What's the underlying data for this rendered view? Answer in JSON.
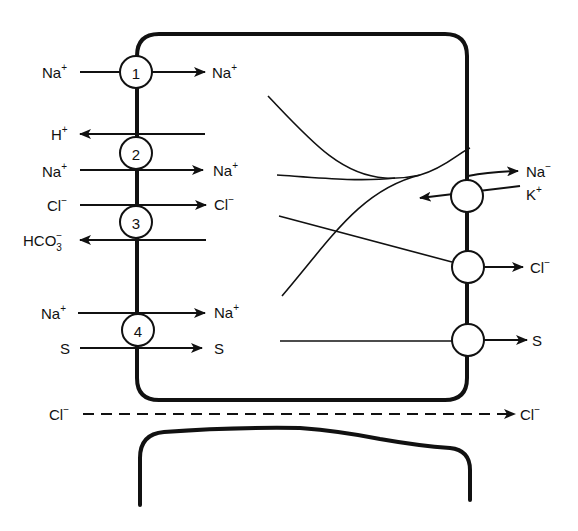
{
  "figure": {
    "type": "epithelial ion transport diagram",
    "apical_transporters": [
      {
        "id": "1",
        "label": "1",
        "in_label": "Na",
        "in_charge": "+",
        "out_label": "Na",
        "out_charge": "+",
        "description": "Na+ channel"
      },
      {
        "id": "2",
        "label": "2",
        "flows": [
          {
            "ion": "H",
            "charge": "+",
            "direction": "out"
          },
          {
            "ion": "Na",
            "charge": "+",
            "direction": "in"
          }
        ]
      },
      {
        "id": "3",
        "label": "3",
        "flows": [
          {
            "ion": "Cl",
            "charge": "−",
            "direction": "in"
          },
          {
            "ion": "HCO",
            "sub": "3",
            "charge": "−",
            "direction": "out"
          }
        ]
      },
      {
        "id": "4",
        "label": "4",
        "flows": [
          {
            "ion": "Na",
            "charge": "+",
            "direction": "in"
          },
          {
            "ion": "S",
            "charge": "",
            "direction": "in"
          }
        ]
      }
    ],
    "basolateral_transporters": [
      {
        "id": "pump",
        "flows": [
          {
            "ion": "Na",
            "charge": "−",
            "direction": "out"
          },
          {
            "ion": "K",
            "charge": "+",
            "direction": "in"
          }
        ]
      },
      {
        "id": "cl-channel",
        "flows": [
          {
            "ion": "Cl",
            "charge": "−",
            "direction": "out"
          }
        ]
      },
      {
        "id": "s-carrier",
        "flows": [
          {
            "ion": "S",
            "charge": "",
            "direction": "out"
          }
        ]
      }
    ],
    "paracellular": {
      "ion": "Cl",
      "charge": "−",
      "style": "dashed",
      "direction": "out"
    }
  },
  "labels": {
    "t1_left": "Na",
    "t1_left_sup": "+",
    "t1_right": "Na",
    "t1_right_sup": "+",
    "t1_num": "1",
    "t2_h": "H",
    "t2_h_sup": "+",
    "t2_na_left": "Na",
    "t2_na_left_sup": "+",
    "t2_na_right": "Na",
    "t2_na_right_sup": "+",
    "t2_num": "2",
    "t3_cl_left": "Cl",
    "t3_cl_left_sup": "−",
    "t3_cl_right": "Cl",
    "t3_cl_right_sup": "−",
    "t3_hco": "HCO",
    "t3_hco_sub": "3",
    "t3_hco_sup": "−",
    "t3_num": "3",
    "t4_na_left": "Na",
    "t4_na_left_sup": "+",
    "t4_na_right": "Na",
    "t4_na_right_sup": "+",
    "t4_s_left": "S",
    "t4_s_right": "S",
    "t4_num": "4",
    "bl_na": "Na",
    "bl_na_sup": "−",
    "bl_k": "K",
    "bl_k_sup": "+",
    "bl_cl": "Cl",
    "bl_cl_sup": "−",
    "bl_s": "S",
    "para_cl_left": "Cl",
    "para_cl_left_sup": "−",
    "para_cl_right": "Cl",
    "para_cl_right_sup": "−"
  }
}
